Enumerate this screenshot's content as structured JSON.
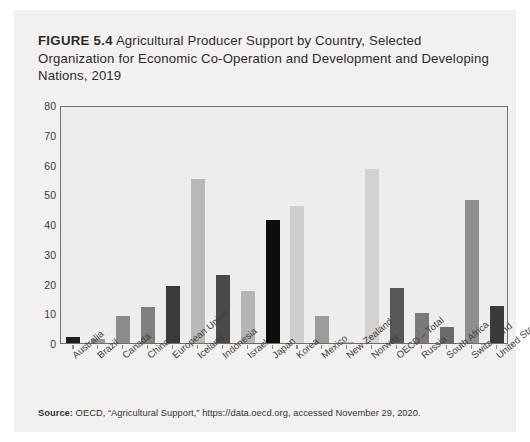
{
  "figure": {
    "number_label": "FIGURE 5.4",
    "title_text": " Agricultural Producer Support by Country, Selected Organization for Economic Co-Operation and Development and Developing Nations, 2019",
    "source_label": "Source:",
    "source_text": " OECD, “Agricultural Support,” https://data.oecd.org, accessed November 29, 2020."
  },
  "chart_data": {
    "type": "bar",
    "title": "FIGURE 5.4 Agricultural Producer Support by Country, Selected Organization for Economic Co-Operation and Development and Developing Nations, 2019",
    "xlabel": "",
    "ylabel": "",
    "ylim": [
      0,
      80
    ],
    "yticks": [
      0,
      10,
      20,
      30,
      40,
      50,
      60,
      70,
      80
    ],
    "ytick_labels": [
      "0",
      "10",
      "20",
      "30",
      "40",
      "50",
      "60",
      "70",
      "80"
    ],
    "grid": false,
    "legend": "none",
    "categories": [
      "Australia",
      "Brazil",
      "Canada",
      "China",
      "European Union",
      "Iceland",
      "Indonesia",
      "Israel",
      "Japan",
      "Korea",
      "Mexico",
      "New Zealand",
      "Norway",
      "OECD – Total",
      "Russia",
      "South Africa",
      "Switzerland",
      "United States"
    ],
    "values": [
      2,
      1.2,
      9,
      12,
      19,
      55,
      23,
      17.5,
      41.5,
      46,
      9,
      0.4,
      58.5,
      18.5,
      10,
      5.5,
      48,
      12.5
    ],
    "bar_colors": [
      "#1f1f1f",
      "#9a9a9a",
      "#8b8b8b",
      "#808080",
      "#3b3b3b",
      "#b9b9b9",
      "#4a4a4a",
      "#b5b5b5",
      "#0d0d0d",
      "#cfcfcf",
      "#9c9c9c",
      "#b0b0b0",
      "#d2d2d2",
      "#575757",
      "#7a7a7a",
      "#6b6b6b",
      "#8f8f8f",
      "#3a3a3a"
    ]
  },
  "colors": {
    "card_background": "#f2f1ef",
    "plot_background": "#eeedeb",
    "axis": "#6f6f6f",
    "text": "#2b2b2b"
  }
}
